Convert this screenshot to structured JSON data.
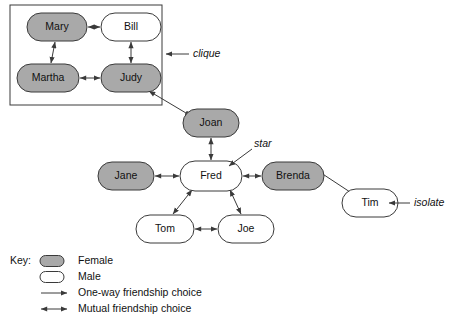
{
  "diagram": {
    "colors": {
      "female_fill": "#a9a9a9",
      "male_fill": "#ffffff",
      "stroke": "#3a3a3a",
      "background": "#ffffff"
    },
    "nodes": [
      {
        "id": "mary",
        "label": "Mary",
        "gender": "Female",
        "x": 57,
        "y": 27,
        "rx": 30,
        "ry": 14
      },
      {
        "id": "bill",
        "label": "Bill",
        "gender": "Male",
        "x": 131,
        "y": 27,
        "rx": 30,
        "ry": 14
      },
      {
        "id": "martha",
        "label": "Martha",
        "gender": "Female",
        "x": 48,
        "y": 78,
        "rx": 31,
        "ry": 14
      },
      {
        "id": "judy",
        "label": "Judy",
        "gender": "Female",
        "x": 131,
        "y": 78,
        "rx": 30,
        "ry": 14
      },
      {
        "id": "joan",
        "label": "Joan",
        "gender": "Female",
        "x": 211,
        "y": 123,
        "rx": 28,
        "ry": 14
      },
      {
        "id": "jane",
        "label": "Jane",
        "gender": "Female",
        "x": 126,
        "y": 176,
        "rx": 28,
        "ry": 14
      },
      {
        "id": "fred",
        "label": "Fred",
        "gender": "Male",
        "x": 211,
        "y": 176,
        "rx": 31,
        "ry": 15
      },
      {
        "id": "brenda",
        "label": "Brenda",
        "gender": "Female",
        "x": 293,
        "y": 176,
        "rx": 31,
        "ry": 14
      },
      {
        "id": "tim",
        "label": "Tim",
        "gender": "Male",
        "x": 370,
        "y": 203,
        "rx": 28,
        "ry": 14
      },
      {
        "id": "tom",
        "label": "Tom",
        "gender": "Male",
        "x": 165,
        "y": 229,
        "rx": 29,
        "ry": 14
      },
      {
        "id": "joe",
        "label": "Joe",
        "gender": "Male",
        "x": 246,
        "y": 229,
        "rx": 28,
        "ry": 14
      }
    ],
    "edges": [
      {
        "from": "mary",
        "to": "bill",
        "type": "mutual",
        "x1": 88,
        "y1": 27,
        "x2": 100,
        "y2": 27
      },
      {
        "from": "mary",
        "to": "martha",
        "type": "mutual",
        "x1": 55,
        "y1": 42,
        "x2": 51,
        "y2": 63
      },
      {
        "from": "bill",
        "to": "judy",
        "type": "mutual",
        "x1": 131,
        "y1": 42,
        "x2": 131,
        "y2": 63
      },
      {
        "from": "martha",
        "to": "judy",
        "type": "mutual",
        "x1": 80,
        "y1": 78,
        "x2": 100,
        "y2": 78
      },
      {
        "from": "judy",
        "to": "joan",
        "type": "mutual",
        "x1": 149,
        "y1": 91,
        "x2": 191,
        "y2": 116
      },
      {
        "from": "joan",
        "to": "fred",
        "type": "mutual",
        "x1": 211,
        "y1": 138,
        "x2": 211,
        "y2": 160
      },
      {
        "from": "jane",
        "to": "fred",
        "type": "mutual",
        "x1": 155,
        "y1": 176,
        "x2": 179,
        "y2": 176
      },
      {
        "from": "fred",
        "to": "brenda",
        "type": "mutual",
        "x1": 243,
        "y1": 176,
        "x2": 261,
        "y2": 176
      },
      {
        "from": "fred",
        "to": "tom",
        "type": "mutual",
        "x1": 192,
        "y1": 190,
        "x2": 173,
        "y2": 214
      },
      {
        "from": "fred",
        "to": "joe",
        "type": "mutual",
        "x1": 230,
        "y1": 190,
        "x2": 241,
        "y2": 214
      },
      {
        "from": "tom",
        "to": "joe",
        "type": "mutual",
        "x1": 195,
        "y1": 229,
        "x2": 217,
        "y2": 229
      },
      {
        "from": "tim",
        "to": "brenda",
        "type": "one-way",
        "x1": 350,
        "y1": 192,
        "x2": 312,
        "y2": 167
      }
    ],
    "groups": [
      {
        "id": "clique-box",
        "x": 10,
        "y": 5,
        "width": 152,
        "height": 100
      }
    ],
    "annotations": [
      {
        "id": "clique",
        "label": "clique",
        "text_x": 193,
        "text_y": 54,
        "line_x1": 189,
        "line_y1": 54,
        "line_x2": 166,
        "line_y2": 54
      },
      {
        "id": "star",
        "label": "star",
        "text_x": 254,
        "text_y": 144,
        "line_x1": 252,
        "line_y1": 149,
        "line_x2": 229,
        "line_y2": 166
      },
      {
        "id": "isolate",
        "label": "isolate",
        "text_x": 414,
        "text_y": 203,
        "line_x1": 410,
        "line_y1": 203,
        "line_x2": 389,
        "line_y2": 203
      }
    ],
    "key": {
      "title": "Key:",
      "title_x": 10,
      "title_y": 261,
      "items": [
        {
          "id": "female",
          "label": "Female",
          "symbol": "gray-pill",
          "y": 261
        },
        {
          "id": "male",
          "label": "Male",
          "symbol": "white-pill",
          "y": 277
        },
        {
          "id": "one-way",
          "label": "One-way friendship choice",
          "symbol": "single-arrow",
          "y": 293
        },
        {
          "id": "mutual",
          "label": "Mutual friendship choice",
          "symbol": "double-arrow",
          "y": 309
        }
      ]
    }
  }
}
